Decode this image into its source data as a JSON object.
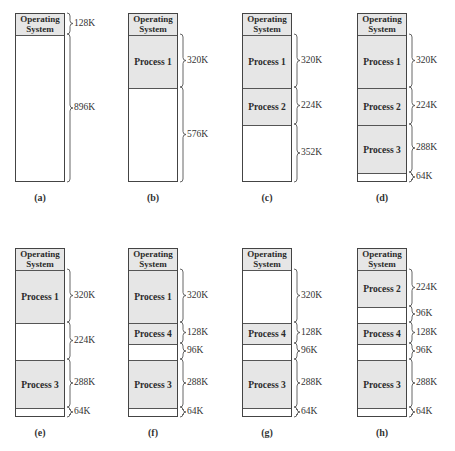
{
  "figure": {
    "panels": [
      {
        "id": "a",
        "caption": "(a)",
        "segments": [
          {
            "label": "Operating System",
            "type": "os",
            "size": "128K",
            "kb": 128
          },
          {
            "label": "",
            "type": "free",
            "size": "896K",
            "kb": 896
          }
        ]
      },
      {
        "id": "b",
        "caption": "(b)",
        "segments": [
          {
            "label": "Operating System",
            "type": "os",
            "size": "",
            "kb": 128
          },
          {
            "label": "Process 1",
            "type": "process",
            "size": "320K",
            "kb": 320
          },
          {
            "label": "",
            "type": "free",
            "size": "576K",
            "kb": 576
          }
        ]
      },
      {
        "id": "c",
        "caption": "(c)",
        "segments": [
          {
            "label": "Operating System",
            "type": "os",
            "size": "",
            "kb": 128
          },
          {
            "label": "Process 1",
            "type": "process",
            "size": "320K",
            "kb": 320
          },
          {
            "label": "Process 2",
            "type": "process",
            "size": "224K",
            "kb": 224
          },
          {
            "label": "",
            "type": "free",
            "size": "352K",
            "kb": 352
          }
        ]
      },
      {
        "id": "d",
        "caption": "(d)",
        "segments": [
          {
            "label": "Operating System",
            "type": "os",
            "size": "",
            "kb": 128
          },
          {
            "label": "Process 1",
            "type": "process",
            "size": "320K",
            "kb": 320
          },
          {
            "label": "Process 2",
            "type": "process",
            "size": "224K",
            "kb": 224
          },
          {
            "label": "Process 3",
            "type": "process",
            "size": "288K",
            "kb": 288
          },
          {
            "label": "",
            "type": "free",
            "size": "64K",
            "kb": 64
          }
        ]
      },
      {
        "id": "e",
        "caption": "(e)",
        "segments": [
          {
            "label": "Operating System",
            "type": "os",
            "size": "",
            "kb": 128
          },
          {
            "label": "Process 1",
            "type": "process",
            "size": "320K",
            "kb": 320
          },
          {
            "label": "",
            "type": "free",
            "size": "224K",
            "kb": 224
          },
          {
            "label": "Process 3",
            "type": "process",
            "size": "288K",
            "kb": 288
          },
          {
            "label": "",
            "type": "free",
            "size": "64K",
            "kb": 64
          }
        ]
      },
      {
        "id": "f",
        "caption": "(f)",
        "segments": [
          {
            "label": "Operating System",
            "type": "os",
            "size": "",
            "kb": 128
          },
          {
            "label": "Process 1",
            "type": "process",
            "size": "320K",
            "kb": 320
          },
          {
            "label": "Process 4",
            "type": "process",
            "size": "128K",
            "kb": 128
          },
          {
            "label": "",
            "type": "free",
            "size": "96K",
            "kb": 96
          },
          {
            "label": "Process 3",
            "type": "process",
            "size": "288K",
            "kb": 288
          },
          {
            "label": "",
            "type": "free",
            "size": "64K",
            "kb": 64
          }
        ]
      },
      {
        "id": "g",
        "caption": "(g)",
        "segments": [
          {
            "label": "Operating System",
            "type": "os",
            "size": "",
            "kb": 128
          },
          {
            "label": "",
            "type": "free",
            "size": "320K",
            "kb": 320
          },
          {
            "label": "Process 4",
            "type": "process",
            "size": "128K",
            "kb": 128
          },
          {
            "label": "",
            "type": "free",
            "size": "96K",
            "kb": 96
          },
          {
            "label": "Process 3",
            "type": "process",
            "size": "288K",
            "kb": 288
          },
          {
            "label": "",
            "type": "free",
            "size": "64K",
            "kb": 64
          }
        ]
      },
      {
        "id": "h",
        "caption": "(h)",
        "segments": [
          {
            "label": "Operating System",
            "type": "os",
            "size": "",
            "kb": 128
          },
          {
            "label": "Process 2",
            "type": "process",
            "size": "224K",
            "kb": 224
          },
          {
            "label": "",
            "type": "free",
            "size": "96K",
            "kb": 96
          },
          {
            "label": "Process 4",
            "type": "process",
            "size": "128K",
            "kb": 128
          },
          {
            "label": "",
            "type": "free",
            "size": "96K",
            "kb": 96
          },
          {
            "label": "Process 3",
            "type": "process",
            "size": "288K",
            "kb": 288
          },
          {
            "label": "",
            "type": "free",
            "size": "64K",
            "kb": 64
          }
        ]
      }
    ],
    "colors": {
      "process_fill": "#e6e6e6",
      "free_fill": "#ffffff",
      "border": "#444444"
    }
  }
}
